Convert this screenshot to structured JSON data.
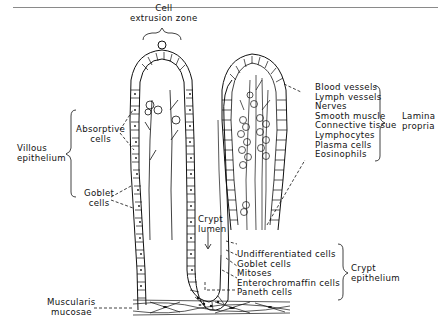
{
  "figure": {
    "type": "anatomical-diagram",
    "labels": {
      "cell_extrusion_zone": [
        "Cell",
        "extrusion zone"
      ],
      "absorptive_cells": [
        "Absorptive",
        "cells"
      ],
      "villous_epithelium": [
        "Villous",
        "epithelium"
      ],
      "goblet_cells_villus": [
        "Goblet",
        "cells"
      ],
      "crypt_lumen": [
        "Crypt",
        "lumen"
      ],
      "muscularis_mucosae": [
        "Muscularis",
        "mucosae"
      ],
      "lamina_propria_title": [
        "Lamina",
        "propria"
      ],
      "lamina_propria_items": [
        "Blood vessels",
        "Lymph vessels",
        "Nerves",
        "Smooth muscle",
        "Connective tissue",
        "Lymphocytes",
        "Plasma cells",
        "Eosinophils"
      ],
      "crypt_epithelium_title": [
        "Crypt",
        "epithelium"
      ],
      "crypt_epithelium_items": [
        "Undifferentiated cells",
        "Goblet cells",
        "Mitoses",
        "Enterochromaffin cells",
        "Paneth cells"
      ]
    },
    "colors": {
      "ink": "#111111",
      "rule": "#8a8a8a",
      "background": "#ffffff"
    }
  }
}
